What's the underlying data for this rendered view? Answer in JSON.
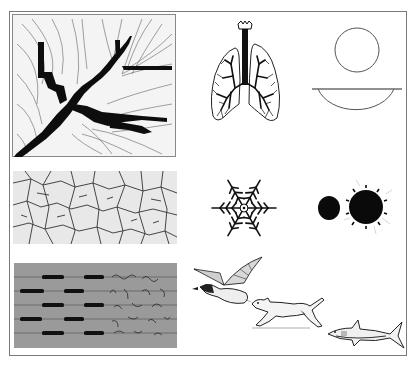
{
  "figure": {
    "panels": [
      {
        "id": "tree-drainage",
        "description": "branching tree/drainage pattern with flow lines"
      },
      {
        "id": "lungs",
        "description": "human lungs with bronchial tree"
      },
      {
        "id": "sphere-and-bowl",
        "description": "circle above a horizontal line with a half-circle bowl beneath"
      },
      {
        "id": "cracked-mud",
        "description": "cracked dry mud texture"
      },
      {
        "id": "snowflake",
        "description": "six-armed snowflake"
      },
      {
        "id": "drops",
        "description": "small black disc beside a larger spiky black disc"
      },
      {
        "id": "flow-streaks",
        "description": "grey panel with horizontal dark streaks and turbulent wake"
      },
      {
        "id": "duck",
        "description": "flying duck"
      },
      {
        "id": "dog",
        "description": "running dog"
      },
      {
        "id": "shark",
        "description": "swimming shark"
      }
    ]
  },
  "colors": {
    "ink": "#111111",
    "frame": "#7a7a7a",
    "grey_panel": "#9a9a9a",
    "background": "#ffffff"
  }
}
